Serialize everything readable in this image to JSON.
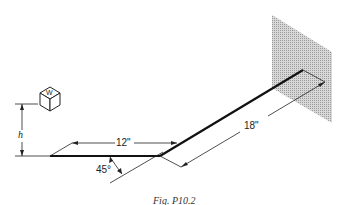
{
  "figure": {
    "caption": "Fig. P10.2",
    "labels": {
      "height": "h",
      "weight": "W",
      "short_arm": "12\"",
      "long_arm": "18\"",
      "angle": "45°"
    }
  }
}
